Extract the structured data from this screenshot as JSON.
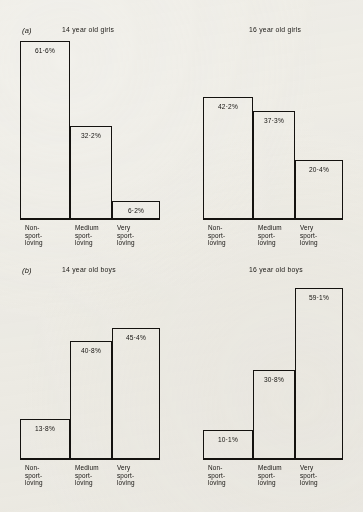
{
  "figure": {
    "panels": [
      {
        "letter": "(a)",
        "charts": [
          {
            "title": "14 year old girls",
            "categories": [
              "Non-\nsport-\nloving",
              "Medium\nsport-\nloving",
              "Very\nsport-\nloving"
            ],
            "values": [
              61.6,
              32.2,
              6.2
            ],
            "labels": [
              "61·6%",
              "32·2%",
              "6·2%"
            ]
          },
          {
            "title": "16 year old girls",
            "categories": [
              "Non-\nsport-\nloving",
              "Medium\nsport-\nloving",
              "Very\nsport-\nloving"
            ],
            "values": [
              42.2,
              37.3,
              20.4
            ],
            "labels": [
              "42·2%",
              "37·3%",
              "20·4%"
            ]
          }
        ]
      },
      {
        "letter": "(b)",
        "charts": [
          {
            "title": "14 year old boys",
            "categories": [
              "Non-\nsport-\nloving",
              "Medium\nsport-\nloving",
              "Very\nsport-\nloving"
            ],
            "values": [
              13.8,
              40.8,
              45.4
            ],
            "labels": [
              "13·8%",
              "40·8%",
              "45·4%"
            ]
          },
          {
            "title": "16 year old boys",
            "categories": [
              "Non-\nsport-\nloving",
              "Medium\nsport-\nloving",
              "Very\nsport-\nloving"
            ],
            "values": [
              10.1,
              30.8,
              59.1
            ],
            "labels": [
              "10·1%",
              "30·8%",
              "59·1%"
            ]
          }
        ]
      }
    ]
  },
  "chart_data": [
    {
      "type": "bar",
      "title": "14 year old girls",
      "panel": "(a)",
      "categories": [
        "Non-sport-loving",
        "Medium sport-loving",
        "Very sport-loving"
      ],
      "values": [
        61.6,
        32.2,
        6.2
      ],
      "data_labels": [
        "61·6%",
        "32·2%",
        "6·2%"
      ],
      "xlabel": "",
      "ylabel": "",
      "ylim": [
        0,
        70
      ],
      "grid": false,
      "legend": "none"
    },
    {
      "type": "bar",
      "title": "16 year old girls",
      "panel": "(a)",
      "categories": [
        "Non-sport-loving",
        "Medium sport-loving",
        "Very sport-loving"
      ],
      "values": [
        42.2,
        37.3,
        20.4
      ],
      "data_labels": [
        "42·2%",
        "37·3%",
        "20·4%"
      ],
      "xlabel": "",
      "ylabel": "",
      "ylim": [
        0,
        70
      ],
      "grid": false,
      "legend": "none"
    },
    {
      "type": "bar",
      "title": "14 year old boys",
      "panel": "(b)",
      "categories": [
        "Non-sport-loving",
        "Medium sport-loving",
        "Very sport-loving"
      ],
      "values": [
        13.8,
        40.8,
        45.4
      ],
      "data_labels": [
        "13·8%",
        "40·8%",
        "45·4%"
      ],
      "xlabel": "",
      "ylabel": "",
      "ylim": [
        0,
        70
      ],
      "grid": false,
      "legend": "none"
    },
    {
      "type": "bar",
      "title": "16 year old boys",
      "panel": "(b)",
      "categories": [
        "Non-sport-loving",
        "Medium sport-loving",
        "Very sport-loving"
      ],
      "values": [
        10.1,
        30.8,
        59.1
      ],
      "data_labels": [
        "10·1%",
        "30·8%",
        "59·1%"
      ],
      "xlabel": "",
      "ylabel": "",
      "ylim": [
        0,
        70
      ],
      "grid": false,
      "legend": "none"
    }
  ]
}
